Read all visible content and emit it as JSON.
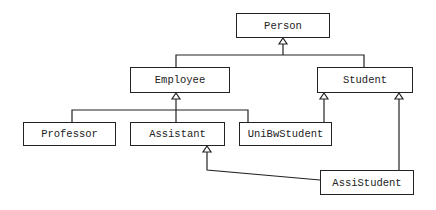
{
  "diagram": {
    "type": "uml-class-inheritance",
    "classes": [
      {
        "id": "person",
        "label": "Person"
      },
      {
        "id": "employee",
        "label": "Employee"
      },
      {
        "id": "student",
        "label": "Student"
      },
      {
        "id": "professor",
        "label": "Professor"
      },
      {
        "id": "assistant",
        "label": "Assistant"
      },
      {
        "id": "unibwstudent",
        "label": "UniBwStudent"
      },
      {
        "id": "assistudent",
        "label": "AssiStudent"
      }
    ],
    "generalizations": [
      {
        "child": "Employee",
        "parent": "Person"
      },
      {
        "child": "Student",
        "parent": "Person"
      },
      {
        "child": "Professor",
        "parent": "Employee"
      },
      {
        "child": "Assistant",
        "parent": "Employee"
      },
      {
        "child": "UniBwStudent",
        "parent": "Employee"
      },
      {
        "child": "UniBwStudent",
        "parent": "Student"
      },
      {
        "child": "AssiStudent",
        "parent": "Student"
      },
      {
        "child": "AssiStudent",
        "parent": "Assistant"
      }
    ]
  }
}
